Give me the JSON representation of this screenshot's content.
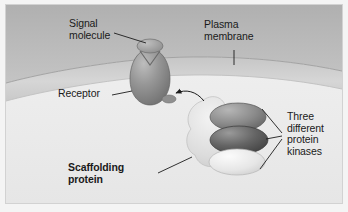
{
  "figure": {
    "domain": "biology-diagram",
    "background_color": "#e9e9e9",
    "frame_color": "#d2d2d2"
  },
  "regions": {
    "extracellular": {
      "name": "extracellular-space",
      "color": "#b9b9b9"
    },
    "membrane": {
      "name": "plasma-membrane-band",
      "color": "#cfcfcf",
      "edge_color": "#a8a8a8"
    },
    "cytoplasm": {
      "name": "cytoplasm",
      "color": "#efefef"
    }
  },
  "labels": {
    "signal_molecule": {
      "text": "Signal\nmolecule",
      "line1": "Signal",
      "line2": "molecule",
      "bold": false
    },
    "receptor": {
      "text": "Receptor",
      "bold": false
    },
    "plasma_membrane": {
      "line1": "Plasma",
      "line2": "membrane",
      "bold": false
    },
    "scaffolding_protein": {
      "line1": "Scaffolding",
      "line2": "protein",
      "bold": true
    },
    "protein_kinases": {
      "line1": "Three",
      "line2": "different",
      "line3": "protein",
      "line4": "kinases",
      "bold": false
    }
  },
  "structures": {
    "signal_molecule": {
      "name": "signal-molecule",
      "shape": "small-oval",
      "color": "#9a9a9a"
    },
    "receptor": {
      "name": "receptor",
      "shape": "egg-with-notch",
      "color": "#8e8e8e"
    },
    "scaffolding_protein": {
      "name": "scaffolding-protein",
      "shape": "lobed-blob",
      "color": "#dedede"
    },
    "kinases": [
      {
        "name": "protein-kinase-1",
        "position": "top",
        "color": "#8c8c8c"
      },
      {
        "name": "protein-kinase-2",
        "position": "middle",
        "color": "#6a6a6a"
      },
      {
        "name": "protein-kinase-3",
        "position": "bottom",
        "color": "#e4e4e4"
      }
    ]
  },
  "connectors": {
    "activation_arrow": {
      "name": "activation-arrow",
      "from": "scaffolding-complex",
      "to": "receptor",
      "style": "curved-arrow"
    },
    "kinase_bracket": {
      "name": "kinase-leader-bracket",
      "count": 3
    }
  }
}
